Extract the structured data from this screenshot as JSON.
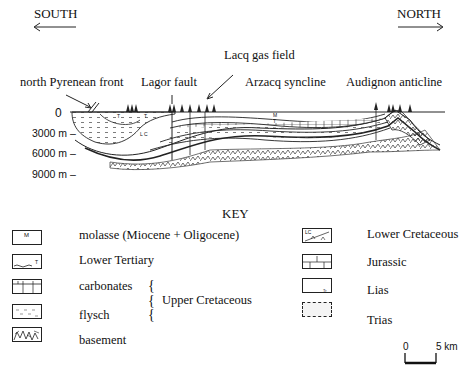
{
  "directions": {
    "south": "SOUTH",
    "north": "NORTH",
    "south_arrow": "<———",
    "north_arrow": "———>"
  },
  "annotations": {
    "lacq": "Lacq gas field",
    "pyrenean": "north Pyrenean front",
    "lagor": "Lagor fault",
    "arzacq": "Arzacq syncline",
    "audignon": "Audignon anticline"
  },
  "depth_axis": {
    "labels": [
      "0",
      "3000 m –",
      "6000 m –",
      "9000 m –"
    ]
  },
  "section_marks": {
    "T": "T",
    "M": "M",
    "LC": "L C"
  },
  "key": {
    "title": "KEY",
    "items": [
      {
        "label": "molasse (Miocene + Oligocene)",
        "symbol": "M"
      },
      {
        "label": "Lower Tertiary",
        "symbol": "T"
      },
      {
        "label": "carbonates",
        "symbol": ""
      },
      {
        "label": "flysch",
        "symbol": ""
      },
      {
        "label": "basement",
        "symbol": ""
      },
      {
        "label": "Lower Cretaceous",
        "symbol": "LC"
      },
      {
        "label": "Jurassic",
        "symbol": ""
      },
      {
        "label": "Lias",
        "symbol": "Tr"
      },
      {
        "label": "Trias",
        "symbol": ""
      }
    ],
    "group_label": "Upper Cretaceous",
    "brace": "{"
  },
  "scale_bar": {
    "start": "0",
    "end": "5 km"
  }
}
